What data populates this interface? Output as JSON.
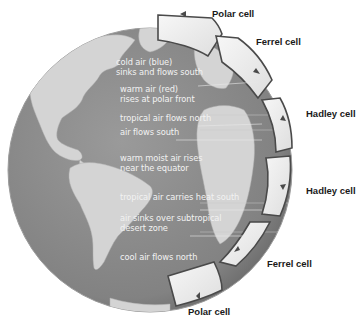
{
  "diagram": {
    "colors": {
      "ocean": "#8a8a8a",
      "land": "#d6d6d6",
      "cell_fill": "#eeeeee",
      "cell_outline": "#4a4a4a",
      "annotation_text": "#f2f2f2",
      "label_text": "#1a1a1a"
    },
    "cell_labels": [
      {
        "id": "polar-north",
        "text": "Polar cell"
      },
      {
        "id": "ferrel-north",
        "text": "Ferrel cell"
      },
      {
        "id": "hadley-north",
        "text": "Hadley cell"
      },
      {
        "id": "hadley-south",
        "text": "Hadley cell"
      },
      {
        "id": "ferrel-south",
        "text": "Ferrel cell"
      },
      {
        "id": "polar-south",
        "text": "Polar cell"
      }
    ],
    "annotations": [
      {
        "line1": "cold air (blue)",
        "line2": "sinks and flows south"
      },
      {
        "line1": "warm air (red)",
        "line2": "rises at polar front"
      },
      {
        "line1": "tropical air flows north",
        "line2": ""
      },
      {
        "line1": "air flows south",
        "line2": ""
      },
      {
        "line1": "warm moist air rises",
        "line2": "near the equator"
      },
      {
        "line1": "tropical air carries heat south",
        "line2": ""
      },
      {
        "line1": "air sinks over subtropical",
        "line2": "desert zone"
      },
      {
        "line1": "cool air flows north",
        "line2": ""
      }
    ]
  }
}
